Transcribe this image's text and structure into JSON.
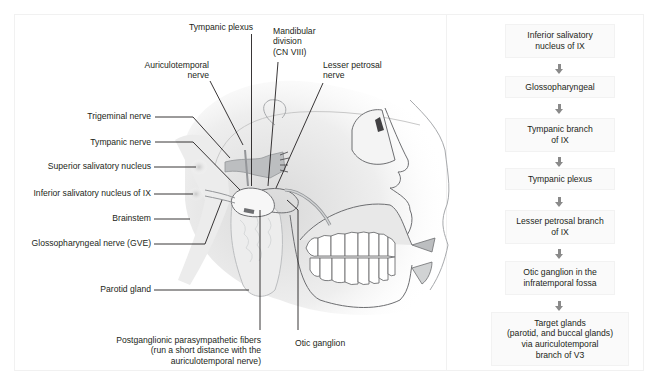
{
  "figure": {
    "type": "anatomical-diagram",
    "topic": "Parasympathetic pathway of the glossopharyngeal nerve (CN IX) to the parotid gland"
  },
  "labels": {
    "tympanic_plexus": "Tympanic plexus",
    "mandibular_division": [
      "Mandibular",
      "division",
      "(CN VIII)"
    ],
    "auriculotemporal_nerve": [
      "Auriculotemporal",
      "nerve"
    ],
    "lesser_petrosal_nerve": [
      "Lesser petrosal",
      "nerve"
    ],
    "trigeminal_nerve": "Trigeminal nerve",
    "tympanic_nerve": "Tympanic nerve",
    "superior_salivatory_nucleus": "Superior salivatory nucleus",
    "inferior_salivatory_nucleus": "Inferior salivatory nucleus of IX",
    "brainstem": "Brainstem",
    "glossopharyngeal_nerve": "Glossopharyngeal nerve (GVE)",
    "parotid_gland": "Parotid gland",
    "postganglionic_fibers": [
      "Postganglionic parasympathetic fibers",
      "(run a short distance with the",
      "auriculotemporal nerve)"
    ],
    "otic_ganglion": "Otic ganglion"
  },
  "flowchart": {
    "steps": [
      {
        "lines": [
          "Inferior salivatory",
          "nucleus of IX"
        ]
      },
      {
        "lines": [
          "Glossopharyngeal"
        ]
      },
      {
        "lines": [
          "Tympanic branch",
          "of IX"
        ]
      },
      {
        "lines": [
          "Tympanic plexus"
        ]
      },
      {
        "lines": [
          "Lesser petrosal branch",
          "of IX"
        ]
      },
      {
        "lines": [
          "Otic ganglion in the",
          "infratemporal fossa"
        ]
      },
      {
        "lines": [
          "Target glands",
          "(parotid, and buccal glands)",
          "via auriculotemporal",
          "branch of V3"
        ]
      }
    ],
    "arrow_color": "#8a8a8a"
  },
  "colors": {
    "leader_line": "#231f20",
    "outline": "#6d6e71",
    "skin_shade": "#e6e6e6",
    "nerve_fill": "#bcbec0"
  }
}
